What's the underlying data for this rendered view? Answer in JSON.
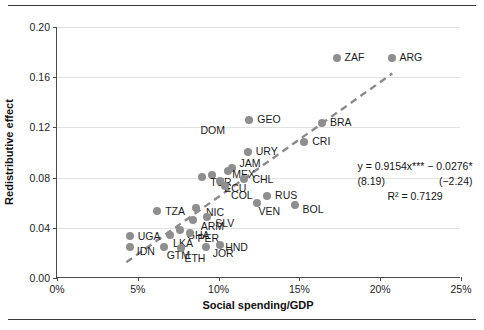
{
  "chart_data": {
    "type": "scatter",
    "title": "",
    "xlabel": "Social spending/GDP",
    "ylabel": "Redistributive effect",
    "xlim": [
      0,
      25
    ],
    "ylim": [
      0.0,
      0.2
    ],
    "xticks": [
      "0%",
      "5%",
      "10%",
      "15%",
      "20%",
      "25%"
    ],
    "xtick_values": [
      0,
      5,
      10,
      15,
      20,
      25
    ],
    "yticks": [
      "0.00",
      "0.04",
      "0.08",
      "0.12",
      "0.16",
      "0.20"
    ],
    "ytick_values": [
      0.0,
      0.04,
      0.08,
      0.12,
      0.16,
      0.2
    ],
    "grid": "horizontal",
    "legend": "none",
    "marker_color": "#8e8e8e",
    "trendline": {
      "style": "dashed",
      "color": "#8a8a8a",
      "slope": 0.9154,
      "intercept": -0.0276,
      "x_start": 4.3,
      "x_end": 20.8
    },
    "annotations": {
      "equation": "y = 0.9154x*** − 0.0276*",
      "t_stat_slope": "(8.19)",
      "t_stat_intercept": "(−2.24)",
      "r_squared": "R² = 0.7129"
    },
    "points": [
      {
        "label": "ZAF",
        "x": 17.3,
        "y": 0.1755,
        "lx": 8,
        "ly": -6
      },
      {
        "label": "ARG",
        "x": 20.7,
        "y": 0.1755,
        "lx": 8,
        "ly": -6
      },
      {
        "label": "GEO",
        "x": 11.9,
        "y": 0.1255,
        "lx": 8,
        "ly": -6
      },
      {
        "label": "BRA",
        "x": 16.4,
        "y": 0.1235,
        "lx": 8,
        "ly": -6
      },
      {
        "label": "CRI",
        "x": 15.3,
        "y": 0.1085,
        "lx": 8,
        "ly": -6
      },
      {
        "label": "URY",
        "x": 11.8,
        "y": 0.1005,
        "lx": 8,
        "ly": -6
      },
      {
        "label": "JAM",
        "x": 10.8,
        "y": 0.088,
        "lx": 8,
        "ly": -10
      },
      {
        "label": "MEX",
        "x": 10.6,
        "y": 0.0855,
        "lx": 4,
        "ly": -2
      },
      {
        "label": "CHL",
        "x": 11.6,
        "y": 0.079,
        "lx": 8,
        "ly": -5
      },
      {
        "label": "TUR",
        "x": 9.6,
        "y": 0.082,
        "lx": -2,
        "ly": 2
      },
      {
        "label": "ECU",
        "x": 10.1,
        "y": 0.0775,
        "lx": 4,
        "ly": 2
      },
      {
        "label": "COL",
        "x": 10.4,
        "y": 0.073,
        "lx": 6,
        "ly": 4
      },
      {
        "label": "RUS",
        "x": 13.0,
        "y": 0.065,
        "lx": 8,
        "ly": -6
      },
      {
        "label": "VEN",
        "x": 12.4,
        "y": 0.06,
        "lx": 1,
        "ly": 3
      },
      {
        "label": "BOL",
        "x": 14.7,
        "y": 0.0585,
        "lx": 8,
        "ly": -1
      },
      {
        "label": "DOM",
        "x": 9.0,
        "y": 0.0805,
        "lx": -2,
        "ly": -52
      },
      {
        "label": "TZA",
        "x": 6.2,
        "y": 0.0535,
        "lx": 8,
        "ly": -5
      },
      {
        "label": "NIC",
        "x": 8.6,
        "y": 0.0555,
        "lx": 10,
        "ly": -1
      },
      {
        "label": "ARM",
        "x": 8.4,
        "y": 0.046,
        "lx": 8,
        "ly": 1
      },
      {
        "label": "SLV",
        "x": 9.3,
        "y": 0.0485,
        "lx": 8,
        "ly": 1
      },
      {
        "label": "GHA",
        "x": 7.6,
        "y": 0.0385,
        "lx": 7,
        "ly": 0
      },
      {
        "label": "PER",
        "x": 8.2,
        "y": 0.0355,
        "lx": 8,
        "ly": 0
      },
      {
        "label": "LKA",
        "x": 7.0,
        "y": 0.0345,
        "lx": 3,
        "ly": 3
      },
      {
        "label": "UGA",
        "x": 4.5,
        "y": 0.0335,
        "lx": 8,
        "ly": -5
      },
      {
        "label": "IDN",
        "x": 4.5,
        "y": 0.025,
        "lx": 7,
        "ly": -1
      },
      {
        "label": "GTM",
        "x": 6.6,
        "y": 0.0245,
        "lx": 3,
        "ly": 3
      },
      {
        "label": "ETH",
        "x": 7.7,
        "y": 0.024,
        "lx": 3,
        "ly": 5
      },
      {
        "label": "JOR",
        "x": 9.2,
        "y": 0.025,
        "lx": 7,
        "ly": 1
      },
      {
        "label": "HND",
        "x": 10.1,
        "y": 0.0265,
        "lx": 5,
        "ly": -3
      }
    ]
  }
}
